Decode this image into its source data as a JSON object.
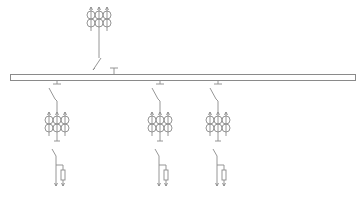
{
  "diagram": {
    "type": "single-line electrical diagram",
    "line_color": "#8a8a8a",
    "background": "#ffffff",
    "busbar": {
      "name": "main-busbar"
    },
    "incoming_feeder": {
      "name": "incoming-feeder",
      "components": [
        "current-transformer-group",
        "disconnector-switch",
        "bus-connection"
      ],
      "ct_count": 6
    },
    "outgoing_feeders": [
      {
        "name": "outgoing-feeder-1",
        "components": [
          "disconnector-switch",
          "current-transformer-group",
          "earthing-switch",
          "surge-arrester",
          "cable-outlet"
        ],
        "ct_count": 6
      },
      {
        "name": "outgoing-feeder-2",
        "components": [
          "disconnector-switch",
          "current-transformer-group",
          "earthing-switch",
          "surge-arrester",
          "cable-outlet"
        ],
        "ct_count": 6
      },
      {
        "name": "outgoing-feeder-3",
        "components": [
          "disconnector-switch",
          "current-transformer-group",
          "earthing-switch",
          "surge-arrester",
          "cable-outlet"
        ],
        "ct_count": 6
      }
    ]
  }
}
